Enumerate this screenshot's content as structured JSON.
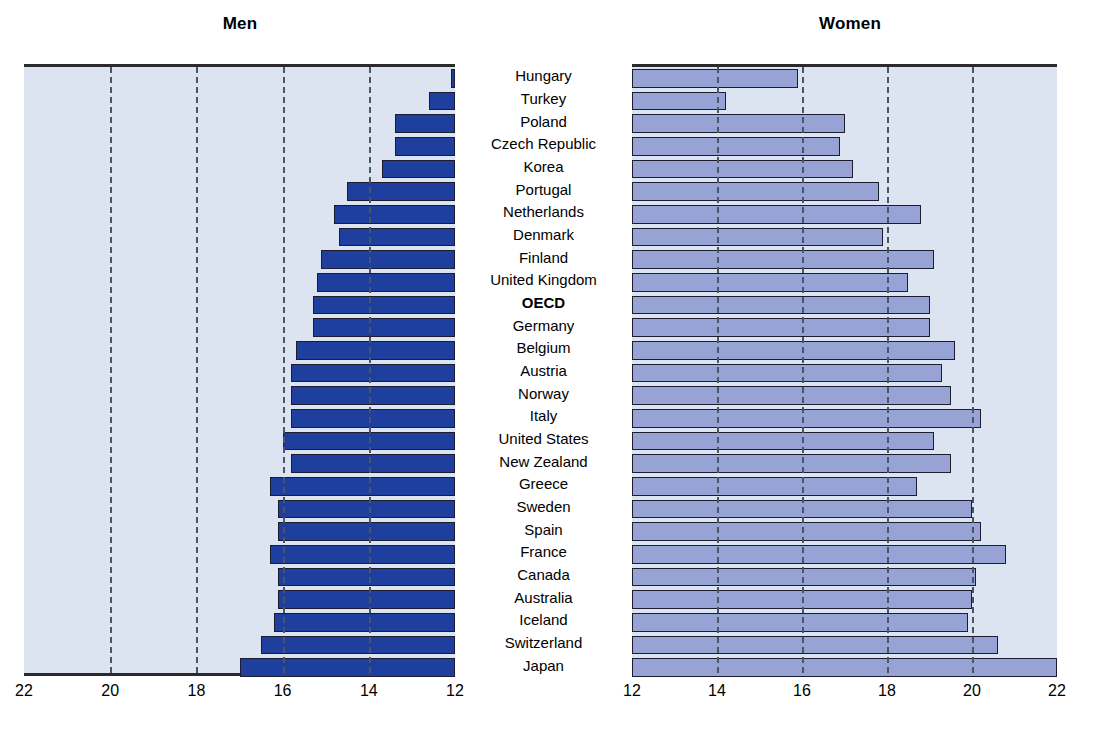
{
  "figure": {
    "panels": [
      {
        "id": "men",
        "title": "Men"
      },
      {
        "id": "women",
        "title": "Women"
      }
    ]
  },
  "chart_data": {
    "type": "bar",
    "title": "",
    "orientation": "horizontal",
    "panels": [
      {
        "name": "Men",
        "title": "Men",
        "xlabel": "",
        "ylabel": "",
        "xlim": [
          22,
          12
        ],
        "reversed": true,
        "ticks": [
          22,
          20,
          18,
          16,
          14,
          12
        ],
        "gridlines": [
          20,
          18,
          16,
          14
        ],
        "grid": true,
        "bar_color": "#1f3f9e"
      },
      {
        "name": "Women",
        "title": "Women",
        "xlabel": "",
        "ylabel": "",
        "xlim": [
          12,
          22
        ],
        "reversed": false,
        "ticks": [
          12,
          14,
          16,
          18,
          20,
          22
        ],
        "gridlines": [
          14,
          16,
          18,
          20
        ],
        "grid": true,
        "bar_color": "#97a3d4"
      }
    ],
    "categories": [
      "Hungary",
      "Turkey",
      "Poland",
      "Czech Republic",
      "Korea",
      "Portugal",
      "Netherlands",
      "Denmark",
      "Finland",
      "United Kingdom",
      "OECD",
      "Germany",
      "Belgium",
      "Austria",
      "Norway",
      "Italy",
      "United States",
      "New Zealand",
      "Greece",
      "Sweden",
      "Spain",
      "France",
      "Canada",
      "Australia",
      "Iceland",
      "Switzerland",
      "Japan"
    ],
    "highlight_categories": [
      "OECD"
    ],
    "series": [
      {
        "name": "Men",
        "values": [
          12.1,
          12.6,
          13.4,
          13.4,
          13.7,
          14.5,
          14.8,
          14.7,
          15.1,
          15.2,
          15.3,
          15.3,
          15.7,
          15.8,
          15.8,
          15.8,
          16.0,
          15.8,
          16.3,
          16.1,
          16.1,
          16.3,
          16.1,
          16.1,
          16.2,
          16.5,
          17.0
        ]
      },
      {
        "name": "Women",
        "values": [
          15.9,
          14.2,
          17.0,
          16.9,
          17.2,
          17.8,
          18.8,
          17.9,
          19.1,
          18.5,
          19.0,
          19.0,
          19.6,
          19.3,
          19.5,
          20.2,
          19.1,
          19.5,
          18.7,
          20.0,
          20.2,
          20.8,
          20.1,
          20.0,
          19.9,
          20.6,
          22.0
        ]
      }
    ]
  }
}
